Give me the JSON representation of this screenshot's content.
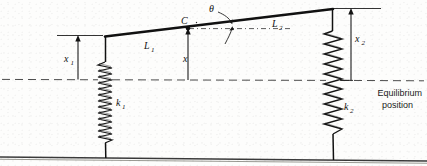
{
  "figure": {
    "type": "mechanical-vibration-schematic",
    "background_color": "#fdfdfc",
    "line_color": "#121212",
    "dashed_color": "#555555",
    "labels": {
      "spring_left_stiffness": "k",
      "spring_left_stiffness_sub": "1",
      "spring_right_stiffness": "k",
      "spring_right_stiffness_sub": "2",
      "length_left": "L",
      "length_left_sub": "1",
      "length_right": "L",
      "length_right_sub": "2",
      "displacement_left": "x",
      "displacement_left_sub": "1",
      "displacement_right": "x",
      "displacement_right_sub": "2",
      "displacement_center": "x",
      "center_of_mass": "C",
      "angle": "θ",
      "equilibrium_line_1": "Equilibrium",
      "equilibrium_line_2": "position"
    },
    "geometry": {
      "bar_left_x": 105,
      "bar_left_y": 36,
      "bar_right_x": 333,
      "bar_right_y": 9,
      "point_c_x": 188,
      "point_c_y": 28,
      "equilibrium_y": 80,
      "ground_left_y": 157,
      "ground_right_y": 161,
      "spring1_center_x": 105,
      "spring1_top_y": 62,
      "spring1_bottom_y": 144,
      "spring1_coils": 26,
      "spring1_half_width": 7,
      "spring2_center_x": 333,
      "spring2_top_y": 31,
      "spring2_bottom_y": 136,
      "spring2_coils": 19,
      "spring2_half_width": 9,
      "x1_arrow_x": 78,
      "x2_arrow_x": 351,
      "theta_label_x": 212,
      "theta_label_y": 9
    }
  }
}
